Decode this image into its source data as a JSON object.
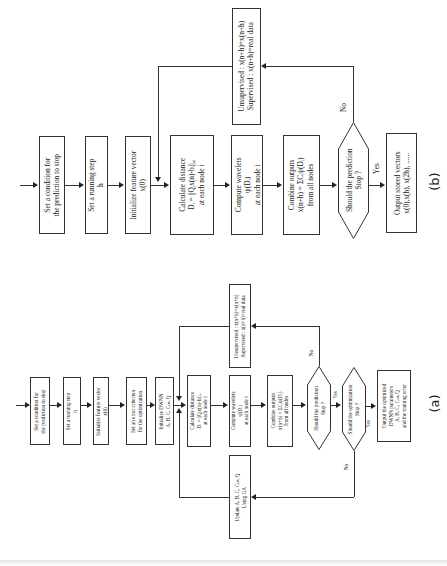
{
  "diagram_b": {
    "caption": "(b)",
    "steps": [
      {
        "lines": [
          "Set a condition for",
          "the prediction to stop"
        ]
      },
      {
        "lines": [
          "Set a running step",
          "h"
        ]
      },
      {
        "lines": [
          "Initialize feature vector",
          "x(0)"
        ]
      },
      {
        "lines": [
          "Calculate distance",
          "Dᵢ = ||Qᵢx(n)-bᵢ||ₐᵢ",
          "at each node i"
        ]
      },
      {
        "lines": [
          "Compute wavelets",
          "ψ(Dᵢ)",
          "at each node i"
        ]
      },
      {
        "lines": [
          "Combine outputs",
          "x(n+h) = ΣCᵢψ(Dᵢ)",
          "from all nodes"
        ]
      }
    ],
    "decision": {
      "lines": [
        "Should the prediction",
        "Stop ?"
      ]
    },
    "output": {
      "lines": [
        "Output stored vectors",
        "x(0),x(h), x(2h), ......"
      ]
    },
    "feedback": {
      "lines": [
        "Unsupervised : x(n+h)=x(n+h)",
        "Supervised : x(n+h)=real data"
      ]
    },
    "labels": {
      "no": "No",
      "yes": "Yes"
    }
  },
  "diagram_a": {
    "caption": "(a)",
    "steps": [
      {
        "lines": [
          "Set a condition for",
          "the prediction to stop"
        ]
      },
      {
        "lines": [
          "Set a running step",
          "h"
        ]
      },
      {
        "lines": [
          "Initialize feature vector",
          "x(0)"
        ]
      },
      {
        "lines": [
          "Set an error criterion",
          "for the optimization"
        ]
      },
      {
        "lines": [
          "Initialize DWNN",
          "A, B, C, Cₗᵢₙ, Q"
        ]
      },
      {
        "lines": [
          "Calculate distance",
          "Dᵢ = ||Qᵢx(n)-bᵢ||ₐᵢ",
          "at each node i"
        ]
      },
      {
        "lines": [
          "Compute wavelets",
          "ψ(Dᵢ)",
          "at each node i"
        ]
      },
      {
        "lines": [
          "Combine outputs",
          "x(n+h) = ΣCᵢψ(Dᵢ)",
          "from all nodes"
        ]
      }
    ],
    "decision1": {
      "lines": [
        "Should the prediction",
        "Stop ?"
      ]
    },
    "decision2": {
      "lines": [
        "Should the optimization",
        "Stop ?"
      ]
    },
    "output": {
      "lines": [
        "Output the optimized",
        "DWNN parameters",
        "A, B, C, Cₗᵢₙ, Q",
        "and the training error"
      ]
    },
    "feedback_top": {
      "lines": [
        "Unsupervised : x(n+h)=x(n+h)",
        "Supervised : x(n+h)=real data"
      ]
    },
    "feedback_bottom": {
      "lines": [
        "Update A, B, C, Cₗᵢₙ, Q",
        "Using GA"
      ]
    },
    "labels": {
      "no1": "No",
      "yes1": "Yes",
      "no2": "No",
      "yes2": "Yes"
    }
  }
}
